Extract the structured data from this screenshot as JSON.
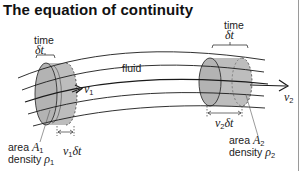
{
  "title": "The equation of continuity",
  "labels": {
    "time_left": "time",
    "delta_t_left": "δt",
    "time_right": "time",
    "delta_t_right": "δt",
    "fluid": "fluid",
    "v1": "v",
    "v1_sub": "1",
    "v2": "v",
    "v2_sub": "2",
    "area_left": "area ",
    "area_left_sym": "A",
    "area_left_sub": "1",
    "density_left": "density ",
    "density_left_sym": "ρ",
    "density_left_sub": "1",
    "v1dt": "v",
    "v1dt_sub": "1",
    "v1dt_tail": "δt",
    "v2dt": "v",
    "v2dt_sub": "2",
    "v2dt_tail": "δt",
    "area_right": "area ",
    "area_right_sym": "A",
    "area_right_sub": "2",
    "density_right": "density ",
    "density_right_sym": "ρ",
    "density_right_sub": "2"
  },
  "colors": {
    "cylinder_fill": "#b8b8b8",
    "line": "#1a1a1a",
    "border": "#9a9a9a"
  }
}
